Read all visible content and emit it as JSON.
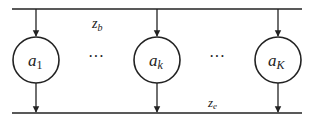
{
  "diagram": {
    "top_bus": {
      "label": "z",
      "subscript": "b"
    },
    "bottom_bus": {
      "label": "z",
      "subscript": "e"
    },
    "nodes": [
      {
        "label": "a",
        "subscript": "1",
        "cx": 36
      },
      {
        "label": "a",
        "subscript": "k",
        "cx": 157
      },
      {
        "label": "a",
        "subscript": "K",
        "cx": 278
      }
    ],
    "ellipses": [
      {
        "text": "···",
        "x": 96
      },
      {
        "text": "···",
        "x": 217
      }
    ],
    "colors": {
      "stroke": "#222222",
      "background": "#ffffff"
    }
  }
}
